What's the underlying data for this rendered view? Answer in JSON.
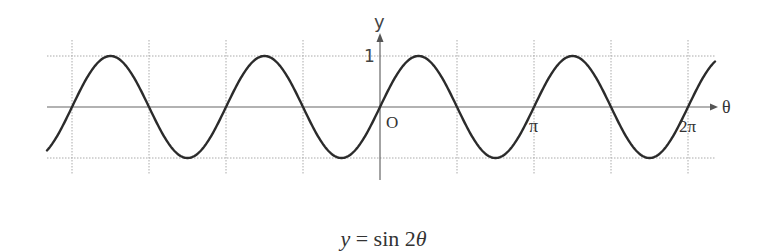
{
  "chart_data": {
    "type": "line",
    "title": "y = sin 2θ",
    "xlabel": "θ",
    "ylabel": "y",
    "function": "sin(2θ)",
    "x_ticks": [
      {
        "value": "π",
        "label": "π"
      },
      {
        "value": "2π",
        "label": "2π"
      }
    ],
    "y_ticks": [
      {
        "value": 1,
        "label": "1"
      }
    ],
    "origin_label": "O",
    "xlim": [
      "-2.33π",
      "2.18π"
    ],
    "ylim": [
      -1,
      1
    ],
    "grid": true,
    "grid_x_step": "π/2",
    "series": [
      {
        "name": "y = sin 2θ",
        "x": [
          "-2π",
          "-7π/4",
          "-3π/2",
          "-5π/4",
          "-π",
          "-3π/4",
          "-π/2",
          "-π/4",
          "0",
          "π/4",
          "π/2",
          "3π/4",
          "π",
          "5π/4",
          "3π/2",
          "7π/4",
          "2π"
        ],
        "values": [
          0,
          1,
          0,
          -1,
          0,
          1,
          0,
          -1,
          0,
          1,
          0,
          -1,
          0,
          1,
          0,
          -1,
          0
        ]
      }
    ]
  },
  "labels": {
    "y_axis": "y",
    "x_axis": "θ",
    "origin": "O",
    "one": "1",
    "pi": "π",
    "two_pi": "2π"
  },
  "caption": {
    "var": "y",
    "rest": " = sin 2",
    "theta": "θ"
  },
  "colors": {
    "curve": "#2b2b2b",
    "axis": "#666666",
    "grid": "#aaaaaa",
    "text": "#333333"
  }
}
